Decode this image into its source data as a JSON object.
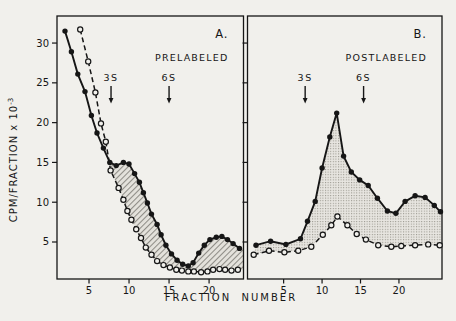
{
  "figure": {
    "background": "#f1f0ec",
    "ink": "#161616",
    "hatch_fill_color": "#e4e2dc",
    "hatch_line_color": "#8e8c86",
    "stipple_fill_color": "#e7e5e0",
    "stipple_dot_color": "#97958c",
    "y_axis_label": "CPM/FRACTION x 10",
    "y_axis_exponent": "-3",
    "x_axis_label": "FRACTION  NUMBER"
  },
  "chart_data": [
    {
      "type": "line",
      "panel_label": "A.",
      "condition_label": "PRELABELED",
      "xlabel": "FRACTION NUMBER",
      "ylabel": "CPM/FRACTION x 10^-3",
      "x_range": [
        1.0,
        24.3
      ],
      "y_range": [
        0.35,
        33.4
      ],
      "x_ticks": [
        5,
        10,
        15,
        20
      ],
      "y_ticks": [
        5,
        10,
        15,
        20,
        25,
        30
      ],
      "y_tick_labels_visible": true,
      "fill_style": "diagonal-hatch",
      "sedimentation_markers": [
        {
          "label": "3S",
          "x": 7.75
        },
        {
          "label": "6S",
          "x": 15.0
        }
      ],
      "series": [
        {
          "name": "prelabeled-filled-circles",
          "marker": "filled-circle",
          "line": "solid",
          "points": [
            [
              2.0,
              31.5
            ],
            [
              2.8,
              28.9
            ],
            [
              3.6,
              26.1
            ],
            [
              4.5,
              23.9
            ],
            [
              5.3,
              20.9
            ],
            [
              6.0,
              18.7
            ],
            [
              6.8,
              16.8
            ],
            [
              7.6,
              15.0
            ],
            [
              8.4,
              14.6
            ],
            [
              9.3,
              15.0
            ],
            [
              10.0,
              14.8
            ],
            [
              10.7,
              13.6
            ],
            [
              11.3,
              12.5
            ],
            [
              11.8,
              11.2
            ],
            [
              12.3,
              9.9
            ],
            [
              12.8,
              8.5
            ],
            [
              13.5,
              7.2
            ],
            [
              14.0,
              5.9
            ],
            [
              14.6,
              4.6
            ],
            [
              15.3,
              3.5
            ],
            [
              16.0,
              2.7
            ],
            [
              16.7,
              2.2
            ],
            [
              17.4,
              2.0
            ],
            [
              18.0,
              2.4
            ],
            [
              18.7,
              3.6
            ],
            [
              19.4,
              4.6
            ],
            [
              20.1,
              5.3
            ],
            [
              20.9,
              5.6
            ],
            [
              21.6,
              5.7
            ],
            [
              22.3,
              5.3
            ],
            [
              23.0,
              4.8
            ],
            [
              23.8,
              4.2
            ]
          ]
        },
        {
          "name": "prelabeled-open-circles",
          "marker": "open-circle",
          "line": "dashed",
          "points": [
            [
              3.9,
              31.7
            ],
            [
              4.9,
              27.7
            ],
            [
              5.8,
              23.8
            ],
            [
              6.5,
              19.9
            ],
            [
              7.1,
              17.6
            ],
            [
              7.7,
              14.0
            ],
            [
              8.7,
              11.8
            ],
            [
              9.3,
              10.3
            ],
            [
              9.8,
              8.9
            ],
            [
              10.3,
              7.8
            ],
            [
              10.9,
              6.6
            ],
            [
              11.5,
              5.5
            ],
            [
              12.1,
              4.3
            ],
            [
              12.8,
              3.4
            ],
            [
              13.5,
              2.6
            ],
            [
              14.3,
              2.1
            ],
            [
              15.1,
              1.8
            ],
            [
              15.9,
              1.5
            ],
            [
              16.6,
              1.4
            ],
            [
              17.4,
              1.3
            ],
            [
              18.1,
              1.3
            ],
            [
              19.0,
              1.2
            ],
            [
              19.8,
              1.3
            ],
            [
              20.5,
              1.5
            ],
            [
              21.3,
              1.6
            ],
            [
              22.0,
              1.5
            ],
            [
              22.8,
              1.4
            ],
            [
              23.6,
              1.5
            ]
          ]
        }
      ],
      "shade": {
        "filled_from": 7,
        "open_from": 5,
        "close_at_right_edge": true
      }
    },
    {
      "type": "line",
      "panel_label": "B.",
      "condition_label": "POSTLABELED",
      "xlabel": "FRACTION NUMBER",
      "ylabel": "CPM/FRACTION x 10^-3",
      "x_range": [
        0.3,
        25.6
      ],
      "y_range": [
        0.35,
        33.4
      ],
      "x_ticks": [
        5,
        10,
        15,
        20
      ],
      "y_ticks": [
        5,
        10,
        15,
        20,
        25,
        30
      ],
      "y_tick_labels_visible": false,
      "fill_style": "stipple",
      "sedimentation_markers": [
        {
          "label": "3S",
          "x": 7.8
        },
        {
          "label": "6S",
          "x": 15.4
        }
      ],
      "series": [
        {
          "name": "postlabeled-filled-circles",
          "marker": "filled-circle",
          "line": "solid",
          "points": [
            [
              1.4,
              4.6
            ],
            [
              3.3,
              5.1
            ],
            [
              5.3,
              4.7
            ],
            [
              7.2,
              5.4
            ],
            [
              8.1,
              7.6
            ],
            [
              9.1,
              10.1
            ],
            [
              10.0,
              14.3
            ],
            [
              11.0,
              18.2
            ],
            [
              11.9,
              21.2
            ],
            [
              12.8,
              15.8
            ],
            [
              13.8,
              13.8
            ],
            [
              14.9,
              12.8
            ],
            [
              16.0,
              12.1
            ],
            [
              17.2,
              10.5
            ],
            [
              18.5,
              8.9
            ],
            [
              19.6,
              8.6
            ],
            [
              20.8,
              10.1
            ],
            [
              22.1,
              10.8
            ],
            [
              23.4,
              10.6
            ],
            [
              24.6,
              9.6
            ],
            [
              25.4,
              8.8
            ]
          ]
        },
        {
          "name": "postlabeled-open-circles",
          "marker": "open-circle",
          "line": "dashed",
          "points": [
            [
              1.1,
              3.4
            ],
            [
              3.1,
              3.9
            ],
            [
              5.1,
              3.7
            ],
            [
              6.9,
              3.9
            ],
            [
              8.6,
              4.4
            ],
            [
              10.1,
              5.9
            ],
            [
              11.2,
              7.1
            ],
            [
              12.0,
              8.2
            ],
            [
              13.3,
              7.1
            ],
            [
              14.5,
              6.0
            ],
            [
              15.7,
              5.3
            ],
            [
              17.3,
              4.6
            ],
            [
              19.0,
              4.4
            ],
            [
              20.3,
              4.5
            ],
            [
              22.1,
              4.6
            ],
            [
              23.8,
              4.7
            ],
            [
              25.3,
              4.6
            ]
          ]
        }
      ],
      "shade": {
        "filled_from": 0,
        "open_from": 0,
        "close_at_right_edge": true
      }
    }
  ]
}
